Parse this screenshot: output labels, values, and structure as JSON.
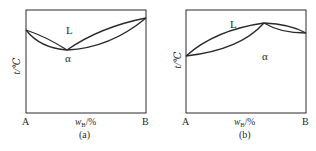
{
  "diagrams": [
    {
      "id": "a",
      "caption": "(a)",
      "y_axis_label": "t/℃",
      "x_axis_label_main": "w",
      "x_axis_label_sub": "B",
      "x_axis_label_unit": "/%",
      "left_end_label": "A",
      "right_end_label": "B",
      "region_liquid_label": "L",
      "region_solid_label": "α",
      "description": "Isomorphous binary phase diagram with a minimum melting point (congruent minimum)"
    },
    {
      "id": "b",
      "caption": "(b)",
      "y_axis_label": "t/℃",
      "x_axis_label_main": "w",
      "x_axis_label_sub": "B",
      "x_axis_label_unit": "/%",
      "left_end_label": "A",
      "right_end_label": "B",
      "region_liquid_label": "L",
      "region_solid_label": "α",
      "description": "Isomorphous binary phase diagram with a maximum melting point (congruent maximum)"
    }
  ],
  "colors": {
    "line": "#2a2a2a",
    "background": "#ffffff"
  }
}
